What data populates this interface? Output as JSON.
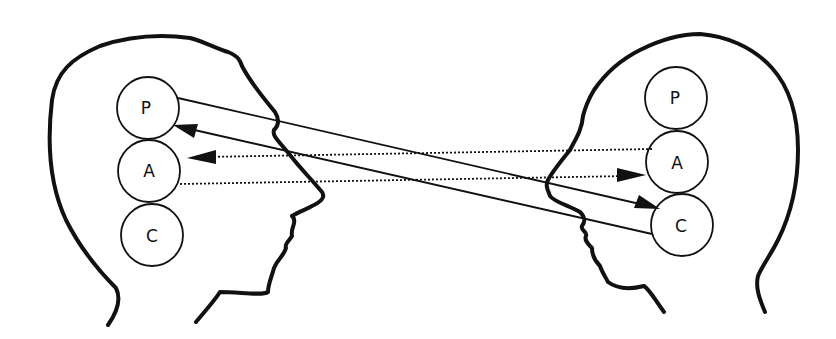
{
  "diagram": {
    "type": "transactional-analysis-crossed-transaction",
    "persons": [
      {
        "id": "left-person",
        "facing": "right",
        "ego_states": [
          {
            "id": "P",
            "label": "P"
          },
          {
            "id": "A",
            "label": "A"
          },
          {
            "id": "C",
            "label": "C"
          }
        ]
      },
      {
        "id": "right-person",
        "facing": "left",
        "ego_states": [
          {
            "id": "P",
            "label": "P"
          },
          {
            "id": "A",
            "label": "A"
          },
          {
            "id": "C",
            "label": "C"
          }
        ]
      }
    ],
    "transactions": [
      {
        "from": "left-person.P",
        "to": "right-person.C",
        "style": "solid"
      },
      {
        "from": "right-person.C",
        "to": "left-person.P",
        "style": "solid"
      },
      {
        "from": "right-person.A",
        "to": "left-person.A",
        "style": "dotted"
      },
      {
        "from": "left-person.A",
        "to": "right-person.A",
        "style": "dotted"
      }
    ],
    "colors": {
      "line": "#111111",
      "background": "#ffffff"
    }
  }
}
